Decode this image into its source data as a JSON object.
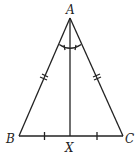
{
  "diagram": {
    "type": "isosceles-triangle",
    "labels": {
      "A": "A",
      "B": "B",
      "C": "C",
      "X": "X"
    },
    "points": {
      "A": [
        70,
        18
      ],
      "B": [
        19,
        136
      ],
      "C": [
        123,
        136
      ],
      "X": [
        70,
        136
      ]
    },
    "marks": {
      "AB": "double-tick",
      "AC": "double-tick",
      "BX": "single-tick",
      "XC": "single-tick",
      "angle_BAX_XAC": "equal-angle-arc"
    },
    "colors": {
      "stroke": "#222222",
      "background": "#ffffff"
    }
  }
}
